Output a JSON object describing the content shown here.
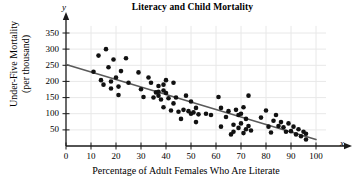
{
  "chart_data": {
    "type": "scatter",
    "title": "Literacy and Child Mortality",
    "xlabel": "Percentage of Adult Females Who Are Literate",
    "ylabel_line1": "Under-Five Mortality",
    "ylabel_line2": "(per thousand)",
    "x_axis_variable": "x",
    "y_axis_variable": "y",
    "xlim": [
      0,
      104
    ],
    "ylim": [
      0,
      375
    ],
    "xticks": [
      0,
      10,
      20,
      30,
      40,
      50,
      60,
      70,
      80,
      90,
      100
    ],
    "yticks": [
      50,
      100,
      150,
      200,
      250,
      300,
      350
    ],
    "grid": true,
    "grid_color": "#e8e8e8",
    "axis_color": "#1a1a1a",
    "point_color": "#111111",
    "trendline_color": "#5a5a5a",
    "trendline": {
      "label": "least-squares regression line",
      "x_start": 0,
      "y_start": 252,
      "x_end": 100,
      "y_end": 20
    },
    "points": [
      [
        11,
        230
      ],
      [
        13,
        280
      ],
      [
        14,
        204
      ],
      [
        15,
        190
      ],
      [
        16,
        300
      ],
      [
        17,
        244
      ],
      [
        18,
        200
      ],
      [
        18,
        178
      ],
      [
        19,
        268
      ],
      [
        20,
        212
      ],
      [
        21,
        158
      ],
      [
        21,
        184
      ],
      [
        22,
        232
      ],
      [
        24,
        272
      ],
      [
        25,
        196
      ],
      [
        29,
        228
      ],
      [
        30,
        176
      ],
      [
        31,
        152
      ],
      [
        33,
        212
      ],
      [
        34,
        196
      ],
      [
        35,
        150
      ],
      [
        36,
        166
      ],
      [
        37,
        186
      ],
      [
        37,
        168
      ],
      [
        37,
        156
      ],
      [
        38,
        144
      ],
      [
        39,
        190
      ],
      [
        39,
        172
      ],
      [
        39,
        120
      ],
      [
        40,
        204
      ],
      [
        40,
        164
      ],
      [
        41,
        148
      ],
      [
        42,
        110
      ],
      [
        43,
        132
      ],
      [
        43,
        196
      ],
      [
        44,
        150
      ],
      [
        45,
        106
      ],
      [
        46,
        84
      ],
      [
        47,
        112
      ],
      [
        48,
        156
      ],
      [
        49,
        108
      ],
      [
        50,
        100
      ],
      [
        50,
        138
      ],
      [
        51,
        104
      ],
      [
        52,
        74
      ],
      [
        52,
        118
      ],
      [
        53,
        98
      ],
      [
        56,
        100
      ],
      [
        58,
        96
      ],
      [
        61,
        152
      ],
      [
        62,
        60
      ],
      [
        62,
        118
      ],
      [
        64,
        90
      ],
      [
        65,
        108
      ],
      [
        66,
        36
      ],
      [
        67,
        44
      ],
      [
        67,
        66
      ],
      [
        68,
        112
      ],
      [
        69,
        56
      ],
      [
        69,
        96
      ],
      [
        70,
        100
      ],
      [
        70,
        70
      ],
      [
        71,
        40
      ],
      [
        71,
        120
      ],
      [
        72,
        84
      ],
      [
        72,
        52
      ],
      [
        73,
        156
      ],
      [
        73,
        62
      ],
      [
        74,
        48
      ],
      [
        78,
        88
      ],
      [
        80,
        110
      ],
      [
        81,
        60
      ],
      [
        82,
        42
      ],
      [
        83,
        78
      ],
      [
        84,
        96
      ],
      [
        85,
        62
      ],
      [
        86,
        74
      ],
      [
        87,
        58
      ],
      [
        88,
        44
      ],
      [
        89,
        70
      ],
      [
        90,
        46
      ],
      [
        91,
        60
      ],
      [
        92,
        36
      ],
      [
        93,
        52
      ],
      [
        94,
        30
      ],
      [
        95,
        44
      ],
      [
        96,
        20
      ],
      [
        96,
        38
      ]
    ]
  }
}
